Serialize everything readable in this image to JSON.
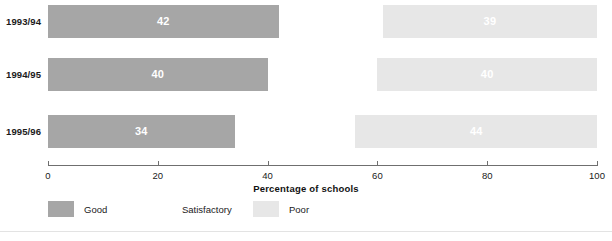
{
  "chart_data": {
    "type": "bar",
    "orientation": "horizontal",
    "stacked": true,
    "title": "",
    "xlabel": "Percentage of schools",
    "ylabel": "",
    "xlim": [
      0,
      100
    ],
    "xticks": [
      0,
      20,
      40,
      60,
      80,
      100
    ],
    "xtick_labels": [
      "0",
      "20",
      "40",
      "60",
      "80",
      "100"
    ],
    "grid": false,
    "legend_position": "bottom-left",
    "categories": [
      "1993/94",
      "1994/95",
      "1995/96"
    ],
    "series": [
      {
        "name": "Good",
        "color": "#a6a6a6",
        "values": [
          42,
          40,
          34
        ],
        "labels": [
          "42",
          "40",
          "34"
        ]
      },
      {
        "name": "Satisfactory",
        "color": "#ffffff",
        "values": [
          19,
          20,
          22
        ],
        "labels": [
          "",
          "",
          ""
        ]
      },
      {
        "name": "Poor",
        "color": "#e7e7e7",
        "values": [
          39,
          40,
          44
        ],
        "labels": [
          "39",
          "40",
          "44"
        ]
      }
    ]
  },
  "axis": {
    "title": "Percentage of schools",
    "ticks": [
      {
        "value": 0,
        "label": "0"
      },
      {
        "value": 20,
        "label": "20"
      },
      {
        "value": 40,
        "label": "40"
      },
      {
        "value": 60,
        "label": "60"
      },
      {
        "value": 80,
        "label": "80"
      },
      {
        "value": 100,
        "label": "100"
      }
    ]
  },
  "legend": {
    "items": [
      {
        "label": "Good",
        "color": "#a6a6a6"
      },
      {
        "label": "Satisfactory",
        "color": "#ffffff"
      },
      {
        "label": "Poor",
        "color": "#e7e7e7"
      }
    ]
  },
  "rows": [
    {
      "category": "1993/94",
      "segments": [
        {
          "series": "Good",
          "value": 42,
          "label": "42",
          "start": 0
        },
        {
          "series": "Satisfactory",
          "value": 19,
          "label": "",
          "start": 42
        },
        {
          "series": "Poor",
          "value": 39,
          "label": "39",
          "start": 61
        }
      ]
    },
    {
      "category": "1994/95",
      "segments": [
        {
          "series": "Good",
          "value": 40,
          "label": "40",
          "start": 0
        },
        {
          "series": "Satisfactory",
          "value": 20,
          "label": "",
          "start": 40
        },
        {
          "series": "Poor",
          "value": 40,
          "label": "40",
          "start": 60
        }
      ]
    },
    {
      "category": "1995/96",
      "segments": [
        {
          "series": "Good",
          "value": 34,
          "label": "34",
          "start": 0
        },
        {
          "series": "Satisfactory",
          "value": 22,
          "label": "",
          "start": 34
        },
        {
          "series": "Poor",
          "value": 44,
          "label": "44",
          "start": 56
        }
      ]
    }
  ],
  "colors": {
    "good": "#a6a6a6",
    "satisfactory": "#ffffff",
    "poor": "#e7e7e7",
    "axis": "#6f6f6f",
    "text": "#1a1a1a",
    "background": "#ffffff",
    "rule": "#e3e3e3"
  }
}
